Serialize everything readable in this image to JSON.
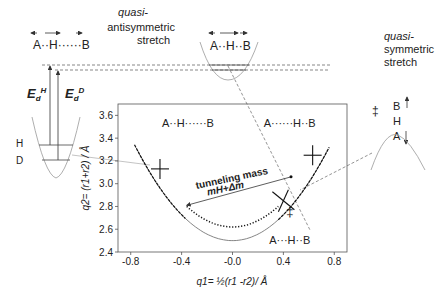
{
  "panel_label": "",
  "left_inset": {
    "complex_label": "A··H······B",
    "energy_labels": {
      "E_H": "E",
      "E_H_sub": "d",
      "E_H_sup": "H",
      "E_D": "E",
      "E_D_sub": "d",
      "E_D_sup": "D"
    },
    "level_labels": [
      "H",
      "D"
    ]
  },
  "top_inset": {
    "mode_label_line1": "quasi-",
    "mode_label_line2": "antisymmetric",
    "mode_label_line3": "stretch",
    "complex_label": "A··H··B"
  },
  "right_inset": {
    "mode_label_line1": "quasi-",
    "mode_label_line2": "symmetric",
    "mode_label_line3": "stretch",
    "atoms": [
      "B",
      "H",
      "A"
    ],
    "ts_symbol": "‡"
  },
  "chart_data": {
    "type": "line",
    "title": "",
    "xlabel": "q1= ½(r1 -r2)/ Å",
    "ylabel": "q2= (r1+r2) / Å",
    "xlim": [
      -0.9,
      0.9
    ],
    "ylim": [
      2.4,
      3.7
    ],
    "xticks": [
      -0.8,
      -0.4,
      -0.0,
      0.4,
      0.8
    ],
    "xtick_labels": [
      "-0.8",
      "-0.4",
      "-0.0",
      "0.4",
      "0.8"
    ],
    "yticks": [
      2.4,
      2.6,
      2.8,
      3.0,
      3.2,
      3.4,
      3.6
    ],
    "ytick_labels": [
      "2.4",
      "2.6",
      "2.8",
      "3.0",
      "3.2",
      "3.4",
      "3.6"
    ],
    "series": [
      {
        "name": "reaction path (solid)",
        "style": "solid",
        "x": [
          -0.75,
          -0.6,
          -0.45,
          -0.3,
          -0.15,
          0.0,
          0.15,
          0.3,
          0.45,
          0.6,
          0.75
        ],
        "y": [
          3.7,
          3.35,
          3.02,
          2.75,
          2.57,
          2.5,
          2.57,
          2.75,
          3.02,
          3.35,
          3.7
        ]
      },
      {
        "name": "tunneling path (dotted)",
        "style": "dotted",
        "x": [
          -0.36,
          -0.25,
          -0.15,
          0.0,
          0.15,
          0.25,
          0.36
        ],
        "y": [
          2.8,
          2.69,
          2.64,
          2.62,
          2.64,
          2.69,
          2.8
        ]
      }
    ],
    "markers": [
      {
        "type": "cross",
        "x": -0.57,
        "y": 3.13
      },
      {
        "type": "cross",
        "x": 0.63,
        "y": 3.25
      },
      {
        "type": "cross-tilted",
        "x": 0.4,
        "y": 2.85
      }
    ],
    "annotations": [
      {
        "text": "A··H······B",
        "x": -0.35,
        "y": 3.5
      },
      {
        "text": "A······H··B",
        "x": 0.45,
        "y": 3.5
      },
      {
        "text": "A···H··B",
        "x": 0.45,
        "y": 2.47
      },
      {
        "text": "tunneling mass",
        "x": 0.0,
        "y": 3.02
      },
      {
        "text": "mH+Δm",
        "x": -0.05,
        "y": 2.93
      },
      {
        "text": "‡",
        "x": 0.45,
        "y": 2.72
      }
    ],
    "tunneling_arrow": {
      "from": [
        -0.36,
        2.81
      ],
      "to": [
        0.46,
        3.06
      ]
    }
  }
}
